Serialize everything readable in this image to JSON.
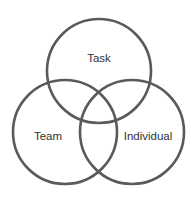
{
  "diagram": {
    "type": "venn",
    "stroke_color": "#5a5a5a",
    "text_color": "#333333",
    "sets": [
      {
        "label": "Task",
        "cx": 99,
        "cy": 71,
        "r": 52,
        "label_x": 99,
        "label_y": 62
      },
      {
        "label": "Team",
        "cx": 65,
        "cy": 132,
        "r": 52,
        "label_x": 48,
        "label_y": 140
      },
      {
        "label": "Individual",
        "cx": 132,
        "cy": 132,
        "r": 52,
        "label_x": 148,
        "label_y": 140
      }
    ]
  }
}
